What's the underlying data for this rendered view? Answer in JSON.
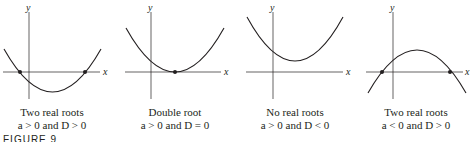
{
  "figure": {
    "label": "FIGURE 9",
    "axis_labels": {
      "x": "x",
      "y": "y"
    },
    "colors": {
      "stroke": "#231f20",
      "background": "#ffffff"
    },
    "panels": [
      {
        "title": "Two real roots",
        "condition": "a > 0 and D > 0",
        "roots": 2,
        "opens": "up"
      },
      {
        "title": "Double root",
        "condition": "a > 0 and D = 0",
        "roots": 1,
        "opens": "up"
      },
      {
        "title": "No real roots",
        "condition": "a > 0 and D < 0",
        "roots": 0,
        "opens": "up"
      },
      {
        "title": "Two real roots",
        "condition": "a < 0 and D > 0",
        "roots": 2,
        "opens": "down"
      }
    ]
  }
}
